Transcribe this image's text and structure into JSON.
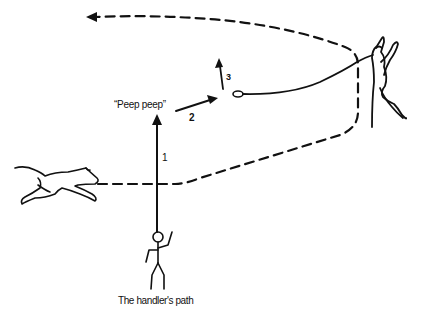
{
  "diagram": {
    "labels": {
      "call": "“Peep peep”",
      "step1": "1",
      "step2": "2",
      "step3": "3",
      "caption": "The handler's path"
    },
    "figures": [
      "running-dog",
      "handler-stick-figure",
      "leaping-dog-on-lead",
      "lead-loop"
    ],
    "paths": [
      "dashed-dog-path",
      "handler-arrow-1",
      "handler-arrow-2",
      "handler-arrow-3"
    ],
    "colors": {
      "ink": "#111111",
      "background": "#ffffff"
    }
  }
}
